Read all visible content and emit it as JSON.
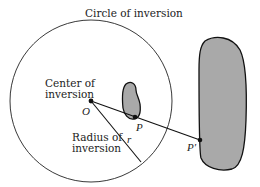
{
  "diagram": {
    "title_label": "Circle of inversion",
    "center_label_line1": "Center of",
    "center_label_line2": "inversion",
    "center_point_label": "O",
    "radius_label_line1": "Radius of",
    "radius_label_line2": "inversion",
    "radius_symbol": "r",
    "point_label": "P",
    "image_point_label": "P′",
    "colors": {
      "shape_fill": "#a9a9a9",
      "stroke": "#111111",
      "background": "#ffffff"
    }
  }
}
